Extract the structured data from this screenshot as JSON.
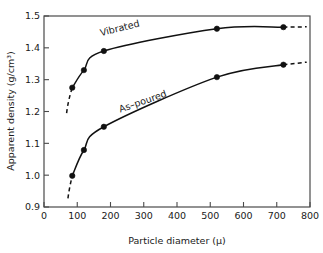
{
  "chart_data": {
    "type": "line",
    "title": "",
    "xlabel": "Particle diameter (μ)",
    "ylabel": "Apparent density (g/cm³)",
    "xlim": [
      0,
      800
    ],
    "ylim": [
      0.9,
      1.5
    ],
    "grid": false,
    "legend_position": "inline-curve-labels",
    "xticks": [
      0,
      100,
      200,
      300,
      400,
      500,
      600,
      700,
      800
    ],
    "xtick_labels": [
      "0",
      "100",
      "200",
      "300",
      "400",
      "500",
      "600",
      "700",
      "800"
    ],
    "yticks": [
      0.9,
      1.0,
      1.1,
      1.2,
      1.3,
      1.4,
      1.5
    ],
    "ytick_labels": [
      "0.9",
      "1.0",
      "1.1",
      "1.2",
      "1.3",
      "1.4",
      "1.5"
    ],
    "series": [
      {
        "name": "Vibrated",
        "label": "Vibrated",
        "color": "#111111",
        "x": [
          85,
          120,
          180,
          520,
          720
        ],
        "values": [
          1.275,
          1.33,
          1.39,
          1.46,
          1.465
        ],
        "dashed_extension_left": {
          "x": [
            68,
            85
          ],
          "y": [
            1.195,
            1.275
          ]
        },
        "dashed_extension_right": {
          "x": [
            720,
            790
          ],
          "y": [
            1.465,
            1.466
          ]
        }
      },
      {
        "name": "As-poured",
        "label": "As–poured",
        "color": "#111111",
        "x": [
          85,
          120,
          180,
          520,
          720
        ],
        "values": [
          0.998,
          1.079,
          1.152,
          1.308,
          1.347
        ],
        "dashed_extension_left": {
          "x": [
            72,
            85
          ],
          "y": [
            0.927,
            0.998
          ]
        },
        "dashed_extension_right": {
          "x": [
            720,
            790
          ],
          "y": [
            1.347,
            1.355
          ]
        }
      }
    ],
    "annotations": [
      {
        "text": "Vibrated",
        "x": 230,
        "y": 1.452,
        "rotation": -14
      },
      {
        "text": "As–poured",
        "x": 300,
        "y": 1.222,
        "rotation": -19
      }
    ]
  }
}
